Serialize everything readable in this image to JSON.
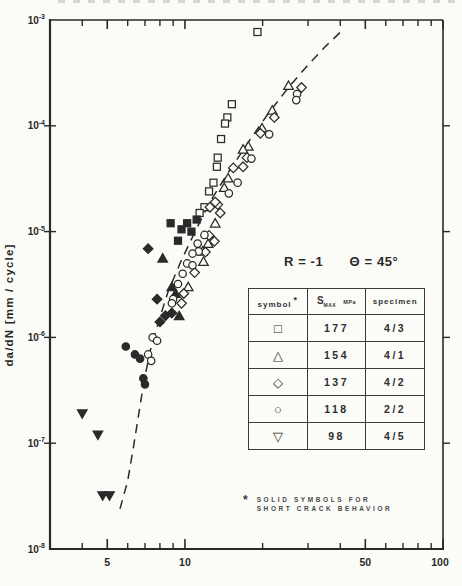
{
  "page": {
    "ink": "#2a2a2a",
    "paper": "#fbfbf8"
  },
  "chart_data": {
    "type": "scatter",
    "title": "",
    "xlabel": "",
    "ylabel": "da/dN  [mm / cycle]",
    "x_scale": "log",
    "y_scale": "log",
    "xlim": [
      3,
      100
    ],
    "ylim": [
      1e-08,
      0.001
    ],
    "grid": false,
    "x_major_ticks": [
      {
        "v": 5,
        "label": "5"
      },
      {
        "v": 10,
        "label": "10"
      },
      {
        "v": 50,
        "label": "50"
      },
      {
        "v": 100,
        "label": "100"
      }
    ],
    "x_minor_ticks": [
      4,
      6,
      7,
      8,
      9,
      20,
      30,
      40,
      60,
      70,
      80,
      90
    ],
    "y_ticks": [
      {
        "v": 0.001,
        "exp": "-3"
      },
      {
        "v": 0.0001,
        "exp": "-4"
      },
      {
        "v": 1e-05,
        "exp": "-5"
      },
      {
        "v": 1e-06,
        "exp": "-6"
      },
      {
        "v": 1e-07,
        "exp": "-7"
      },
      {
        "v": 1e-08,
        "exp": "-8"
      }
    ],
    "annotation": {
      "r": "R = -1",
      "theta": "Θ = 45°"
    },
    "series": [
      {
        "name": "smax-177-long-crack",
        "marker": "square",
        "filled": false,
        "smax": 177,
        "specimen": "4/3",
        "points": [
          [
            19.1,
            0.00077
          ],
          [
            15.2,
            0.00016
          ],
          [
            14.6,
            0.00012
          ],
          [
            14.3,
            0.000105
          ],
          [
            13.8,
            7.5e-05
          ],
          [
            13.4,
            5e-05
          ],
          [
            13.3,
            4.1e-05
          ],
          [
            12.9,
            2.9e-05
          ],
          [
            12.4,
            2.4e-05
          ],
          [
            11.9,
            1.7e-05
          ],
          [
            11.4,
            1.5e-05
          ]
        ]
      },
      {
        "name": "smax-177-short-crack",
        "marker": "square",
        "filled": true,
        "smax": 177,
        "specimen": "4/3",
        "points": [
          [
            8.8,
            1.2e-05
          ],
          [
            9.7,
            1.05e-05
          ],
          [
            10.2,
            1.2e-05
          ],
          [
            10.6,
            1e-05
          ],
          [
            11.1,
            1.3e-05
          ],
          [
            9.4,
            8.2e-06
          ]
        ]
      },
      {
        "name": "smax-154-long-crack",
        "marker": "triangle",
        "filled": false,
        "smax": 154,
        "specimen": "4/1",
        "points": [
          [
            25.2,
            0.00024
          ],
          [
            21.8,
            0.00014
          ],
          [
            19.9,
            9.5e-05
          ],
          [
            17.6,
            6.4e-05
          ],
          [
            16.8,
            6e-05
          ],
          [
            14.7,
            3.2e-05
          ],
          [
            14.2,
            2.6e-05
          ],
          [
            13.1,
            1.2e-05
          ],
          [
            12.3,
            7.7e-06
          ],
          [
            11.7,
            6.5e-06
          ],
          [
            11.8,
            5.2e-06
          ],
          [
            10.3,
            3e-06
          ]
        ]
      },
      {
        "name": "smax-154-short-crack",
        "marker": "triangle",
        "filled": true,
        "smax": 154,
        "specimen": "4/1",
        "points": [
          [
            8.2,
            5.6e-06
          ],
          [
            8.9,
            3e-06
          ],
          [
            9.2,
            2.6e-06
          ],
          [
            9.5,
            1.6e-06
          ]
        ]
      },
      {
        "name": "smax-137-long-crack",
        "marker": "diamond",
        "filled": false,
        "smax": 137,
        "specimen": "4/2",
        "points": [
          [
            28.3,
            0.00023
          ],
          [
            22.2,
            0.00012
          ],
          [
            19.6,
            8.5e-05
          ],
          [
            17.4,
            5e-05
          ],
          [
            16.8,
            4.1e-05
          ],
          [
            15.4,
            4e-05
          ],
          [
            13.4,
            1.8e-05
          ],
          [
            13.1,
            1.9e-05
          ],
          [
            13.7,
            1.5e-05
          ],
          [
            12.5,
            1.7e-05
          ],
          [
            12.4,
            9.2e-06
          ],
          [
            13.0,
            8.1e-06
          ],
          [
            12.0,
            6.4e-06
          ],
          [
            10.9,
            4.1e-06
          ],
          [
            9.9,
            2.6e-06
          ],
          [
            9.7,
            2.1e-06
          ]
        ]
      },
      {
        "name": "smax-137-short-crack",
        "marker": "diamond",
        "filled": true,
        "smax": 137,
        "specimen": "4/2",
        "points": [
          [
            7.2,
            6.9e-06
          ],
          [
            7.8,
            2.3e-06
          ],
          [
            8.4,
            1.6e-06
          ],
          [
            8.9,
            1.7e-06
          ],
          [
            8.0,
            1.4e-06
          ]
        ]
      },
      {
        "name": "smax-118-long-crack",
        "marker": "circle",
        "filled": false,
        "smax": 118,
        "specimen": "2/2",
        "points": [
          [
            27.2,
            0.0002
          ],
          [
            27.0,
            0.000175
          ],
          [
            21.2,
            8.3e-05
          ],
          [
            18.1,
            4.9e-05
          ],
          [
            16.0,
            2.9e-05
          ],
          [
            14.8,
            2.3e-05
          ],
          [
            11.9,
            9.3e-06
          ],
          [
            11.2,
            7.7e-06
          ],
          [
            11.3,
            6.5e-06
          ],
          [
            10.7,
            6.2e-06
          ],
          [
            10.2,
            5e-06
          ],
          [
            10.7,
            4.8e-06
          ],
          [
            9.8,
            4e-06
          ],
          [
            9.4,
            3.2e-06
          ],
          [
            9.0,
            2.3e-06
          ],
          [
            8.9,
            2.1e-06
          ],
          [
            7.5,
            1e-06
          ],
          [
            7.8,
            9.3e-07
          ],
          [
            7.2,
            6.9e-07
          ],
          [
            7.4,
            6e-07
          ]
        ]
      },
      {
        "name": "smax-118-short-crack",
        "marker": "circle",
        "filled": true,
        "smax": 118,
        "specimen": "2/2",
        "points": [
          [
            5.9,
            8.2e-07
          ],
          [
            6.4,
            6.9e-07
          ],
          [
            6.7,
            6.3e-07
          ],
          [
            6.9,
            4.1e-07
          ],
          [
            7.0,
            3.6e-07
          ]
        ]
      },
      {
        "name": "smax-98-short-crack",
        "marker": "inv-triangle",
        "filled": true,
        "smax": 98,
        "specimen": "4/5",
        "points": [
          [
            4.0,
            1.9e-07
          ],
          [
            4.6,
            1.2e-07
          ],
          [
            4.8,
            3.2e-08
          ],
          [
            5.1,
            3.2e-08
          ]
        ]
      }
    ],
    "dashed_curve": {
      "name": "long-crack-trend-line",
      "points": [
        [
          5.6,
          2.4e-08
        ],
        [
          6.0,
          4.4e-08
        ],
        [
          6.3,
          8.9e-08
        ],
        [
          6.6,
          1.8e-07
        ],
        [
          6.9,
          3.5e-07
        ],
        [
          7.3,
          7.2e-07
        ],
        [
          7.9,
          1.4e-06
        ],
        [
          8.6,
          2.7e-06
        ],
        [
          9.6,
          5.1e-06
        ],
        [
          10.9,
          9.8e-06
        ],
        [
          12.5,
          1.9e-05
        ],
        [
          14.7,
          3.6e-05
        ],
        [
          17.6,
          7e-05
        ],
        [
          21.0,
          0.00013
        ],
        [
          25.2,
          0.00023
        ],
        [
          29.8,
          0.00037
        ],
        [
          35.0,
          0.00056
        ],
        [
          41.2,
          0.00082
        ]
      ]
    },
    "legend_table": {
      "headers": {
        "symbol": "symbol",
        "symbol_note": "*",
        "smax_base": "S",
        "smax_sub": "MAX",
        "smax_unit": "MPa",
        "specimen": "specimen"
      },
      "rows": [
        {
          "symbol_char": "□",
          "marker": "square",
          "smax": "177",
          "specimen": "4/3"
        },
        {
          "symbol_char": "△",
          "marker": "triangle",
          "smax": "154",
          "specimen": "4/1"
        },
        {
          "symbol_char": "◇",
          "marker": "diamond",
          "smax": "137",
          "specimen": "4/2"
        },
        {
          "symbol_char": "○",
          "marker": "circle",
          "smax": "118",
          "specimen": "2/2"
        },
        {
          "symbol_char": "▽",
          "marker": "inv-triangle",
          "smax": "98",
          "specimen": "4/5"
        }
      ]
    },
    "footnote": {
      "marker": "*",
      "line1": "SOLID SYMBOLS FOR",
      "line2": "SHORT CRACK BEHAVIOR"
    }
  }
}
